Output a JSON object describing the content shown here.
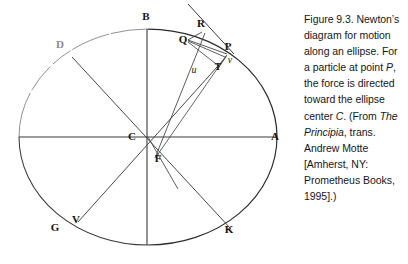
{
  "figure": {
    "number": "Figure 9.3.",
    "ellipse": {
      "center_x": 148,
      "center_y": 137,
      "radius_x": 129,
      "radius_y": 108
    },
    "points": [
      {
        "id": "B",
        "label": "B",
        "x": 146,
        "y": 20,
        "style": "bold",
        "desc": "top of ellipse (minor axis endpoint)"
      },
      {
        "id": "R",
        "label": "R",
        "x": 201,
        "y": 27,
        "style": "bold",
        "desc": "point on tangent line at P"
      },
      {
        "id": "Q",
        "label": "Q",
        "x": 183,
        "y": 43,
        "style": "bold",
        "desc": "nearby point on ellipse arc"
      },
      {
        "id": "P",
        "label": "P",
        "x": 228,
        "y": 50,
        "style": "bold",
        "desc": "orbiting particle position"
      },
      {
        "id": "D",
        "label": "D",
        "x": 60,
        "y": 48,
        "style": "faded",
        "desc": "conjugate diameter endpoint"
      },
      {
        "id": "T",
        "label": "T",
        "x": 218,
        "y": 70,
        "style": "bold-sm",
        "desc": "foot of perpendicular from Q"
      },
      {
        "id": "v",
        "label": "v",
        "x": 230,
        "y": 63,
        "style": "italic",
        "desc": "small v near P"
      },
      {
        "id": "u",
        "label": "u",
        "x": 194,
        "y": 73,
        "style": "italic",
        "desc": "small u on chord"
      },
      {
        "id": "C",
        "label": "C",
        "x": 132,
        "y": 140,
        "style": "bold",
        "desc": "center of ellipse"
      },
      {
        "id": "A",
        "label": "A",
        "x": 275,
        "y": 140,
        "style": "bold",
        "desc": "right end of major axis"
      },
      {
        "id": "F",
        "label": "F",
        "x": 158,
        "y": 162,
        "style": "bold",
        "desc": "focus of ellipse"
      },
      {
        "id": "V",
        "label": "V",
        "x": 76,
        "y": 223,
        "style": "bold",
        "desc": "point on ellipse opposite P"
      },
      {
        "id": "G",
        "label": "G",
        "x": 55,
        "y": 231,
        "style": "bold",
        "desc": "conjugate diameter endpoint opposite D"
      },
      {
        "id": "K",
        "label": "K",
        "x": 229,
        "y": 233,
        "style": "bold",
        "desc": "lower right point on ellipse"
      }
    ],
    "colors": {
      "ink": "#2b2b2b",
      "ink_faded": "#9a9a9a",
      "background": "#ffffff"
    }
  },
  "caption": {
    "line1": "Figure 9.3.",
    "line2": "Newton’s diagram",
    "line3": "for motion along",
    "line4": "an ellipse. For a",
    "line5": "particle at point",
    "line6_italic": "P",
    "line6_rest": ", the force is",
    "line7": "directed toward",
    "line8": "the ellipse center",
    "line9_italic": "C",
    "line9_rest": ". (From ",
    "line9_italic2": "The",
    "line10_italic": "Principia",
    "line10_rest": ", trans.",
    "line11": "Andrew Motte",
    "line12": "[Amherst, NY:",
    "line13": "Prometheus",
    "line14": "Books, 1995].)"
  }
}
